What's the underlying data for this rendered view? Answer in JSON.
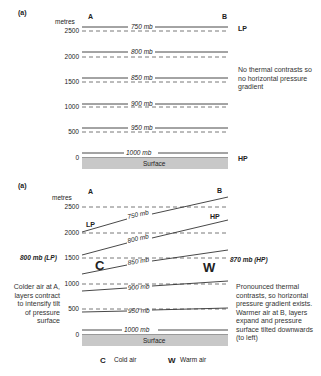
{
  "panel_top": {
    "label": "(a)",
    "units": "metres",
    "point_a": "A",
    "point_b": "B",
    "heights": [
      "2500",
      "2000",
      "1500",
      "1000",
      "500",
      "0"
    ],
    "isobars": [
      "750 mb",
      "800 mb",
      "850 mb",
      "900 mb",
      "950 mb",
      "1000 mb"
    ],
    "surface": "Surface",
    "top_right_label": "LP",
    "bottom_right_label": "HP",
    "note": "No thermal contrasts so no horizontal pressure gradient"
  },
  "panel_bottom": {
    "label": "(a)",
    "units": "metres",
    "point_a": "A",
    "point_b": "B",
    "heights": [
      "2500",
      "2000",
      "1500",
      "1000",
      "500",
      "0"
    ],
    "isobars": [
      "750 mb",
      "800 mb",
      "850 mb",
      "900 mb",
      "950 mb",
      "1000 mb"
    ],
    "surface": "Surface",
    "lp_label": "LP",
    "hp_label": "HP",
    "left_pressure": "800 mb (LP)",
    "right_pressure": "870 mb (HP)",
    "cold_symbol": "C",
    "warm_symbol": "W",
    "left_note": "Colder air at A, layers contract to intensify tilt of pressure surface",
    "right_note": "Pronounced thermal contrasts, so horizontal pressure gradient exists. Warmer air at B, layers expand and pressure surface tilted downwards (to left)"
  },
  "legend": {
    "cold_symbol": "C",
    "cold_label": "Cold air",
    "warm_symbol": "W",
    "warm_label": "Warm air"
  },
  "colors": {
    "line": "#333333",
    "dash": "#555555",
    "surface": "#c8c8c8"
  }
}
